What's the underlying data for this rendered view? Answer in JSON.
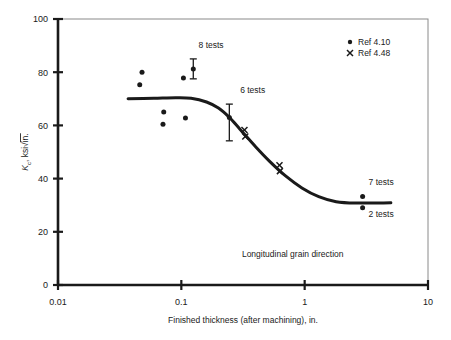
{
  "chart_data": {
    "type": "scatter",
    "title": "",
    "xlabel": "Finished thickness (after machining), in.",
    "ylabel": "Kc, ksi√in.",
    "ylabel_parts": {
      "symbol": "K",
      "subscript": "c",
      "rest": ", ksi",
      "radical": "√",
      "radicand": "in."
    },
    "xscale": "log",
    "yscale": "linear",
    "xlim": [
      0.01,
      10
    ],
    "ylim": [
      0,
      100
    ],
    "xticks": [
      0.01,
      0.1,
      1,
      10
    ],
    "xtick_labels": [
      "0.01",
      "0.1",
      "1",
      "10"
    ],
    "yticks": [
      0,
      20,
      40,
      60,
      80,
      100
    ],
    "ytick_labels": [
      "0",
      "20",
      "40",
      "60",
      "80",
      "100"
    ],
    "grid": false,
    "legend_position": "top-right",
    "legend": [
      {
        "marker": "dot",
        "label": "Ref  4.10"
      },
      {
        "marker": "cross",
        "label": "Ref  4.48"
      }
    ],
    "series": [
      {
        "name": "Ref  4.10",
        "marker": "dot",
        "points": [
          {
            "x": 0.048,
            "y": 80.0
          },
          {
            "x": 0.046,
            "y": 75.3
          },
          {
            "x": 0.072,
            "y": 65.0
          },
          {
            "x": 0.071,
            "y": 60.4
          },
          {
            "x": 0.104,
            "y": 77.8
          },
          {
            "x": 0.108,
            "y": 62.8
          },
          {
            "x": 0.125,
            "y": 81.2,
            "errorbar": [
              77.5,
              85.0
            ],
            "annotation": "8 tests"
          },
          {
            "x": 0.245,
            "y": 63.0,
            "errorbar": [
              54.2,
              68.0
            ],
            "annotation": "6 tests"
          },
          {
            "x": 2.95,
            "y": 33.3,
            "annotation": "7 tests"
          },
          {
            "x": 2.95,
            "y": 29.0,
            "annotation": "2 tests"
          }
        ]
      },
      {
        "name": "Ref  4.48",
        "marker": "cross",
        "points": [
          {
            "x": 0.325,
            "y": 58.3
          },
          {
            "x": 0.33,
            "y": 55.8
          },
          {
            "x": 0.625,
            "y": 45.0
          },
          {
            "x": 0.63,
            "y": 42.8
          }
        ]
      }
    ],
    "curve": {
      "name": "trend",
      "description": "sigmoidal transition curve",
      "points": [
        {
          "x": 0.037,
          "y": 70.0
        },
        {
          "x": 0.06,
          "y": 70.2
        },
        {
          "x": 0.09,
          "y": 70.4
        },
        {
          "x": 0.12,
          "y": 70.2
        },
        {
          "x": 0.16,
          "y": 68.8
        },
        {
          "x": 0.2,
          "y": 66.5
        },
        {
          "x": 0.245,
          "y": 63.0
        },
        {
          "x": 0.3,
          "y": 58.5
        },
        {
          "x": 0.4,
          "y": 52.0
        },
        {
          "x": 0.52,
          "y": 46.5
        },
        {
          "x": 0.7,
          "y": 41.0
        },
        {
          "x": 0.95,
          "y": 36.5
        },
        {
          "x": 1.3,
          "y": 33.2
        },
        {
          "x": 1.8,
          "y": 31.3
        },
        {
          "x": 2.6,
          "y": 30.8
        },
        {
          "x": 5.0,
          "y": 30.9
        }
      ]
    },
    "annotations": [
      {
        "text": "8 tests",
        "x": 0.138,
        "y": 89.0
      },
      {
        "text": "6 tests",
        "x": 0.3,
        "y": 72.0
      },
      {
        "text": "7 tests",
        "x": 3.3,
        "y": 37.5
      },
      {
        "text": "2 tests",
        "x": 3.3,
        "y": 25.5
      },
      {
        "text": "Longitudinal grain direction",
        "x": 0.8,
        "y": 10.5
      }
    ]
  },
  "colors": {
    "ink": "#1a1a1a",
    "frame": "#8a8a8a",
    "background": "#ffffff"
  }
}
